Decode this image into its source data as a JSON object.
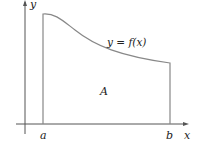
{
  "diagram": {
    "labels": {
      "y_axis": "y",
      "x_axis": "x",
      "curve": "y = f(x)",
      "area": "A",
      "left_bound": "a",
      "right_bound": "b"
    },
    "colors": {
      "axis": "#555555",
      "curve": "#777777",
      "text": "#222222"
    }
  }
}
